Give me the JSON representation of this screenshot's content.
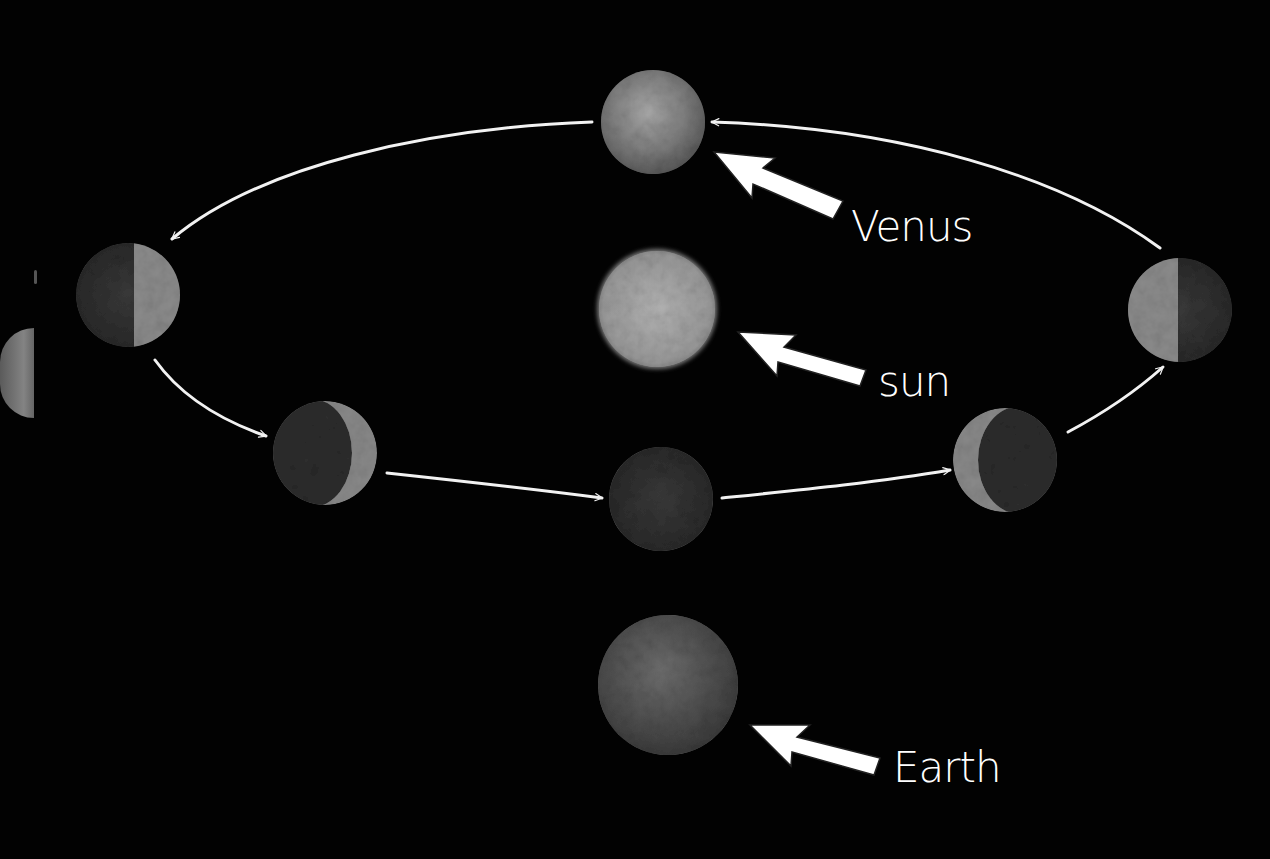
{
  "diagram": {
    "labels": {
      "venus": "Venus",
      "sun": "sun",
      "earth": "Earth"
    },
    "bodies": [
      {
        "id": "venus-top",
        "name": "Venus",
        "phase": "full",
        "cx": 653,
        "cy": 122,
        "r": 52
      },
      {
        "id": "venus-left",
        "name": "Venus",
        "phase": "half-lit (right side lit)",
        "cx": 128,
        "cy": 295,
        "r": 52
      },
      {
        "id": "venus-lower-left",
        "name": "Venus",
        "phase": "crescent (right limb lit)",
        "cx": 325,
        "cy": 453,
        "r": 52
      },
      {
        "id": "venus-bottom",
        "name": "Venus",
        "phase": "new (dark)",
        "cx": 661,
        "cy": 499,
        "r": 52
      },
      {
        "id": "venus-lower-right",
        "name": "Venus",
        "phase": "crescent (left limb lit)",
        "cx": 1005,
        "cy": 460,
        "r": 52
      },
      {
        "id": "venus-right",
        "name": "Venus",
        "phase": "half-lit (left side lit)",
        "cx": 1180,
        "cy": 310,
        "r": 52
      },
      {
        "id": "sun",
        "name": "sun",
        "cx": 657,
        "cy": 309,
        "r": 58
      },
      {
        "id": "earth",
        "name": "Earth",
        "cx": 668,
        "cy": 685,
        "r": 70
      }
    ],
    "orbit_direction": "counter-clockwise (as viewed)",
    "colors": {
      "background": "#020202",
      "arrow": "#f2f2f2",
      "label": "#ffffff"
    }
  }
}
